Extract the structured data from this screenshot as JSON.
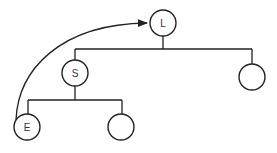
{
  "diagram": {
    "type": "tree",
    "colors": {
      "stroke": "#222222",
      "background": "#ffffff"
    },
    "nodes": [
      {
        "id": "L",
        "label": "L",
        "cx": 163,
        "cy": 23
      },
      {
        "id": "S",
        "label": "S",
        "cx": 75,
        "cy": 73
      },
      {
        "id": "R1",
        "label": "",
        "cx": 252,
        "cy": 77
      },
      {
        "id": "E",
        "label": "E",
        "cx": 27,
        "cy": 127
      },
      {
        "id": "R2",
        "label": "",
        "cx": 121,
        "cy": 127
      }
    ],
    "edges": [
      {
        "from": "L",
        "to": "S"
      },
      {
        "from": "L",
        "to": "R1"
      },
      {
        "from": "S",
        "to": "E"
      },
      {
        "from": "S",
        "to": "R2"
      }
    ],
    "arrows": [
      {
        "from": "E",
        "to": "L",
        "style": "curved"
      }
    ]
  }
}
